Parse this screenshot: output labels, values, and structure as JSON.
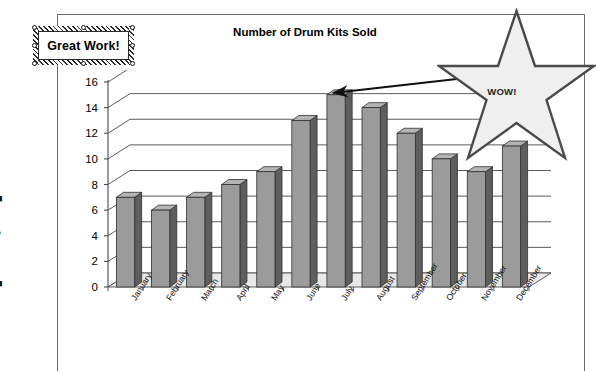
{
  "annotations": {
    "textbox_label": "Great Work!",
    "star_label": "WOW!",
    "arrow_name": "callout-arrow"
  },
  "edge_bleed": {
    "fragment": "■\n:\ne\nl\n.\n■"
  },
  "chart_data": {
    "type": "bar",
    "title": "Number of Drum Kits Sold",
    "xlabel": "",
    "ylabel": "",
    "ylim": [
      0,
      16
    ],
    "yticks": [
      0,
      2,
      4,
      6,
      8,
      10,
      12,
      14,
      16
    ],
    "grid": true,
    "legend": "none",
    "three_d": true,
    "categories": [
      "January",
      "February",
      "March",
      "April",
      "May",
      "June",
      "July",
      "August",
      "September",
      "October",
      "November",
      "December"
    ],
    "values": [
      7,
      6,
      7,
      8,
      9,
      13,
      15,
      14,
      12,
      10,
      9,
      11
    ],
    "colors": {
      "bar_face": "#9b9b9b",
      "bar_side": "#5e5e5e",
      "bar_top": "#b4b4b4",
      "plot_bg": "#ffffff",
      "floor": "#e8e8e8",
      "gridline": "#4a4a4a",
      "star_fill": "#efefef",
      "star_stroke": "#4a4a4a",
      "frame": "#6a6a6a"
    }
  }
}
